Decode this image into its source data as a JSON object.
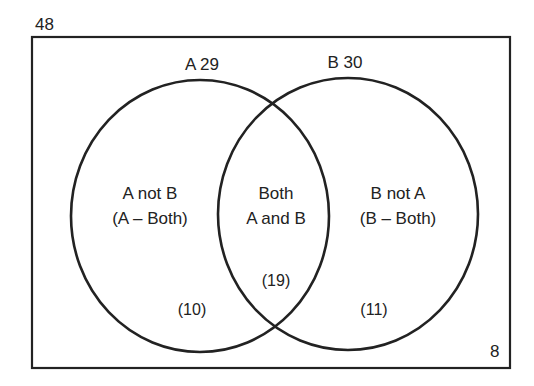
{
  "diagram": {
    "type": "venn",
    "universe": {
      "label": "48",
      "outside_count": "8"
    },
    "sets": [
      {
        "name": "A",
        "label": "A 29",
        "total": 29
      },
      {
        "name": "B",
        "label": "B 30",
        "total": 30
      }
    ],
    "regions": {
      "a_only": {
        "line1": "A not B",
        "line2": "(A – Both)",
        "count": "(10)"
      },
      "both": {
        "line1": "Both",
        "line2": "A and B",
        "count": "(19)"
      },
      "b_only": {
        "line1": "B not A",
        "line2": "(B – Both)",
        "count": "(11)"
      }
    },
    "colors": {
      "stroke": "#222222",
      "background": "#ffffff"
    }
  }
}
